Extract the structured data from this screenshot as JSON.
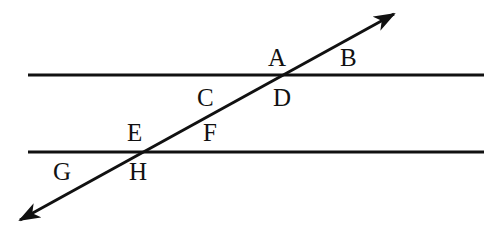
{
  "diagram": {
    "type": "parallel lines cut by a transversal",
    "colors": {
      "stroke": "#111111",
      "background": "#ffffff"
    },
    "lines": {
      "top_parallel": {
        "x1": 28,
        "y1": 75,
        "x2": 484,
        "y2": 75
      },
      "bottom_parallel": {
        "x1": 28,
        "y1": 152,
        "x2": 484,
        "y2": 152
      },
      "transversal": {
        "x1": 20,
        "y1": 220,
        "x2": 394,
        "y2": 14,
        "arrows": "both"
      }
    },
    "labels": [
      {
        "id": "A",
        "text": "A",
        "x": 268,
        "y": 66
      },
      {
        "id": "B",
        "text": "B",
        "x": 340,
        "y": 66
      },
      {
        "id": "C",
        "text": "C",
        "x": 197,
        "y": 106
      },
      {
        "id": "D",
        "text": "D",
        "x": 273,
        "y": 106
      },
      {
        "id": "E",
        "text": "E",
        "x": 127,
        "y": 141
      },
      {
        "id": "F",
        "text": "F",
        "x": 203,
        "y": 141
      },
      {
        "id": "G",
        "text": "G",
        "x": 53,
        "y": 180
      },
      {
        "id": "H",
        "text": "H",
        "x": 129,
        "y": 180
      }
    ]
  }
}
